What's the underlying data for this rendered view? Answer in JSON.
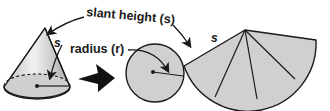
{
  "diagram": {
    "labels": {
      "slant_height": "slant height (s)",
      "radius": "radius (r)",
      "cone_s": "s",
      "sector_s": "s"
    },
    "parts": [
      {
        "id": "cone",
        "description": "right circular cone with dashed hidden base edge and radius drawn"
      },
      {
        "id": "arrow",
        "description": "large black arrow indicating transformation"
      },
      {
        "id": "base-circle",
        "description": "circular base with radius segment"
      },
      {
        "id": "lateral-sector",
        "description": "unrolled lateral surface as circular sector divided into 5 wedges"
      }
    ],
    "colors": {
      "fill": "#d0d0d0",
      "stroke": "#1a1a1a",
      "background": "#ffffff"
    }
  }
}
